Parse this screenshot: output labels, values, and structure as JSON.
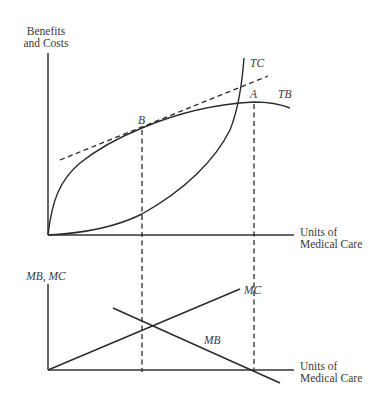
{
  "top_panel": {
    "y_axis_label_line1": "Benefits",
    "y_axis_label_line2": "and Costs",
    "x_axis_label_line1": "Units of",
    "x_axis_label_line2": "Medical Care",
    "curves": {
      "tc_label": "TC",
      "tb_label": "TB"
    },
    "points": {
      "a_label": "A",
      "b_label": "B"
    }
  },
  "bottom_panel": {
    "y_axis_label": "MB, MC",
    "x_axis_label_line1": "Units of",
    "x_axis_label_line2": "Medical Care",
    "lines": {
      "mc_label": "MC",
      "mb_label": "MB"
    }
  },
  "colors": {
    "ink": "#2a2a2a",
    "background": "#ffffff"
  }
}
